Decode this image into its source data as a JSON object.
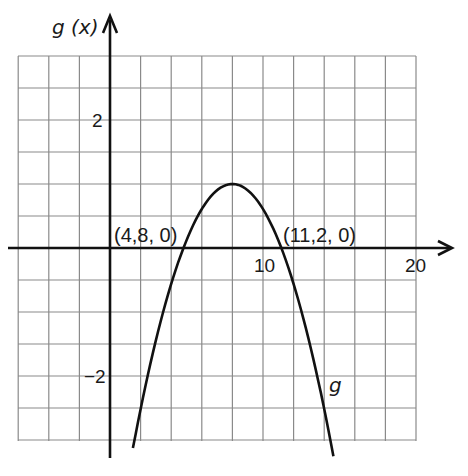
{
  "chart_data": {
    "type": "line",
    "title": "",
    "xlabel": "",
    "ylabel": "g(x)",
    "function_label": "g",
    "function": "g(x) = 1 - (x - 8)^2 / 10.24",
    "xlim": [
      -6,
      20
    ],
    "ylim": [
      -3,
      3
    ],
    "grid": true,
    "grid_x_step": 2,
    "grid_y_step": 0.5,
    "x_tick_labels": [
      {
        "value": 10,
        "label": "10"
      },
      {
        "value": 20,
        "label": "20"
      }
    ],
    "y_tick_labels": [
      {
        "value": 2,
        "label": "2"
      },
      {
        "value": -2,
        "label": "−2"
      }
    ],
    "vertex": {
      "x": 8,
      "y": 1
    },
    "annotations": [
      {
        "text": "(4,8, 0)",
        "x": 4.8,
        "y": 0
      },
      {
        "text": "(11,2, 0)",
        "x": 11.2,
        "y": 0
      }
    ],
    "series": [
      {
        "name": "g",
        "x": [
          1.5,
          2,
          3,
          4,
          4.8,
          6,
          7,
          8,
          9,
          10,
          11.2,
          12,
          13,
          14,
          14.6
        ],
        "y": [
          -3.13,
          -2.52,
          -1.44,
          -0.56,
          0,
          0.61,
          0.9,
          1,
          0.9,
          0.61,
          0,
          -0.56,
          -1.44,
          -2.52,
          -3.25
        ]
      }
    ]
  },
  "labels": {
    "y_axis": "g (x)",
    "curve": "g",
    "tick_2": "2",
    "tick_neg2": "−2",
    "tick_10": "10",
    "tick_20": "20",
    "root_left": "(4,8, 0)",
    "root_right": "(11,2, 0)"
  },
  "colors": {
    "grid": "#8a8a8a",
    "axis": "#111111",
    "curve": "#111111",
    "background": "#ffffff"
  }
}
